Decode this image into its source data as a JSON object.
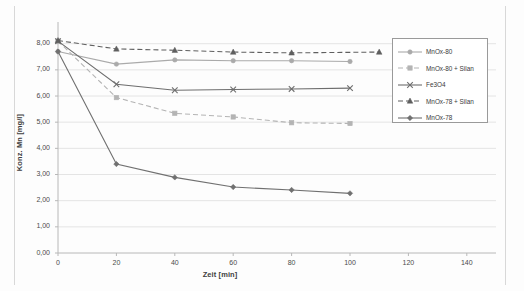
{
  "chart_data": {
    "type": "line",
    "title": "",
    "xlabel": "Zeit [min]",
    "ylabel": "Konz. Mn [mg/l]",
    "xlim": [
      0,
      150
    ],
    "ylim": [
      0,
      8.6
    ],
    "xticks": [
      0,
      20,
      40,
      60,
      80,
      100,
      120,
      140
    ],
    "xtick_labels": [
      "0",
      "20",
      "40",
      "60",
      "80",
      "100",
      "120",
      "140"
    ],
    "yticks": [
      0,
      1,
      2,
      3,
      4,
      5,
      6,
      7,
      8
    ],
    "ytick_labels": [
      "0,00",
      "1,00",
      "2,00",
      "3,00",
      "4,00",
      "5,00",
      "6,00",
      "7,00",
      "8,00"
    ],
    "grid": "horizontal",
    "legend_position": "right",
    "series": [
      {
        "name": "MnOx-80",
        "marker": "circle",
        "linestyle": "solid",
        "color": "#aaaaaa",
        "x": [
          0,
          20,
          40,
          60,
          80,
          100
        ],
        "y": [
          7.7,
          7.22,
          7.38,
          7.35,
          7.35,
          7.32
        ]
      },
      {
        "name": "MnOx-80 + Silan",
        "marker": "square",
        "linestyle": "dashed",
        "color": "#b4b4b4",
        "x": [
          0,
          20,
          40,
          60,
          80,
          100
        ],
        "y": [
          8.1,
          5.94,
          5.34,
          5.2,
          4.98,
          4.95
        ]
      },
      {
        "name": "Fe3O4",
        "marker": "cross",
        "linestyle": "solid",
        "color": "#6e6e6e",
        "x": [
          0,
          20,
          40,
          60,
          80,
          100
        ],
        "y": [
          8.1,
          6.45,
          6.22,
          6.25,
          6.27,
          6.3
        ]
      },
      {
        "name": "MnOx-78 + Silan",
        "marker": "triangle",
        "linestyle": "dashed",
        "color": "#5f5f5f",
        "x": [
          0,
          20,
          40,
          60,
          80,
          110
        ],
        "y": [
          8.12,
          7.8,
          7.75,
          7.68,
          7.65,
          7.68
        ]
      },
      {
        "name": "MnOx-78",
        "marker": "diamond",
        "linestyle": "solid",
        "color": "#707070",
        "x": [
          0,
          20,
          40,
          60,
          80,
          100
        ],
        "y": [
          7.7,
          3.4,
          2.89,
          2.52,
          2.41,
          2.28
        ]
      }
    ]
  },
  "legend": {
    "items": [
      {
        "label": "MnOx-80"
      },
      {
        "label": "MnOx-80 + Silan"
      },
      {
        "label": "Fe3O4"
      },
      {
        "label": "MnOx-78 + Silan"
      },
      {
        "label": "MnOx-78"
      }
    ]
  }
}
